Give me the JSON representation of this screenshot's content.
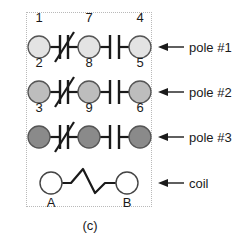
{
  "figure": {
    "caption": "(c)",
    "kind": "relay-schematic",
    "border_color": "#b9b9b9",
    "line_color": "#1a1a1a"
  },
  "poles": [
    {
      "id": "pole1",
      "label": "pole #1",
      "fill_color": "#e3e3e3",
      "terminals": {
        "left": "1",
        "middle": "7",
        "right": "4"
      },
      "contacts": {
        "left_to_middle": "normally-closed",
        "middle_to_right": "normally-open"
      }
    },
    {
      "id": "pole2",
      "label": "pole #2",
      "fill_color": "#bdbdbd",
      "terminals": {
        "left": "2",
        "middle": "8",
        "right": "5"
      },
      "contacts": {
        "left_to_middle": "normally-closed",
        "middle_to_right": "normally-open"
      }
    },
    {
      "id": "pole3",
      "label": "pole #3",
      "fill_color": "#8a8a8a",
      "terminals": {
        "left": "3",
        "middle": "9",
        "right": "6"
      },
      "contacts": {
        "left_to_middle": "normally-closed",
        "middle_to_right": "normally-open"
      }
    }
  ],
  "coil": {
    "id": "coil",
    "label": "coil",
    "fill_color": "#ffffff",
    "terminals": {
      "left": "A",
      "right": "B"
    }
  }
}
